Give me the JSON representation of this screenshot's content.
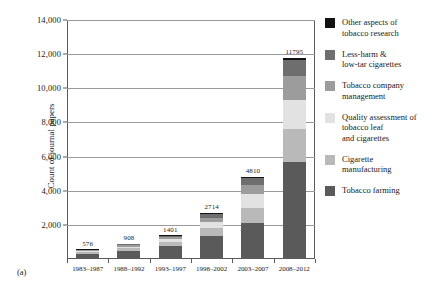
{
  "panel_caption": "(a)",
  "axis": {
    "ylabel": "Count of journal papers",
    "yticks": [
      "14,000",
      "12,000",
      "10,000",
      "8,000",
      "6,000",
      "4,000",
      "2,000"
    ],
    "ytick_values": [
      14000,
      12000,
      10000,
      8000,
      6000,
      4000,
      2000
    ]
  },
  "legend": {
    "items": [
      {
        "label": "Other aspects of\ntobacco research",
        "color": "#121212"
      },
      {
        "label": "Less-harm &\nlow-tar cigarettes",
        "color": "#6e6e6e"
      },
      {
        "label": "Tobacco company\nmanagement",
        "color": "#9c9c9c"
      },
      {
        "label": "Quality assessment of\ntobacco leaf\nand cigarettes",
        "color": "#e2e2e2"
      },
      {
        "label": "Cigarette\nmanufacturing",
        "color": "#b9b9b9"
      },
      {
        "label": "Tobacco farming",
        "color": "#5a5a5a"
      }
    ]
  },
  "chart_data": {
    "type": "bar",
    "subtype": "stacked-bar",
    "title": "",
    "xlabel": "",
    "ylabel": "Count of journal papers",
    "ylim": [
      0,
      14000
    ],
    "grid": true,
    "legend_position": "right",
    "categories": [
      "1983–1987",
      "1988–1992",
      "1993–1997",
      "1998–2002",
      "2003–2007",
      "2008–2012"
    ],
    "totals": [
      576,
      908,
      1401,
      2714,
      4810,
      11795
    ],
    "total_labels": [
      "576",
      "908",
      "1401",
      "2714",
      "4810",
      "11795"
    ],
    "series": [
      {
        "name": "Tobacco farming",
        "color": "#5a5a5a",
        "values": [
          310,
          470,
          760,
          1370,
          2120,
          5700
        ]
      },
      {
        "name": "Cigarette manufacturing",
        "color": "#b9b9b9",
        "values": [
          90,
          150,
          250,
          460,
          880,
          1900
        ]
      },
      {
        "name": "Quality assessment of tobacco leaf and cigarettes",
        "color": "#e2e2e2",
        "values": [
          60,
          110,
          180,
          350,
          780,
          1700
        ]
      },
      {
        "name": "Tobacco company management",
        "color": "#9c9c9c",
        "values": [
          50,
          80,
          110,
          250,
          530,
          1400
        ]
      },
      {
        "name": "Less-harm & low-tar cigarettes",
        "color": "#6e6e6e",
        "values": [
          46,
          70,
          70,
          220,
          420,
          950
        ]
      },
      {
        "name": "Other aspects of tobacco research",
        "color": "#121212",
        "values": [
          20,
          28,
          31,
          64,
          80,
          145
        ]
      }
    ]
  }
}
